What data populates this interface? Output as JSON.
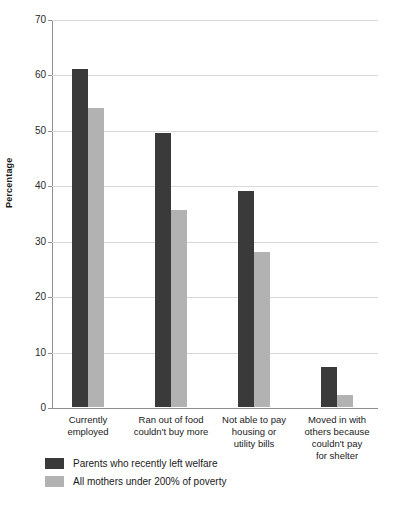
{
  "chart_data": {
    "type": "bar",
    "title": "",
    "xlabel": "",
    "ylabel": "Percentage",
    "ylim": [
      0,
      70
    ],
    "yticks": [
      0,
      10,
      20,
      30,
      40,
      50,
      60,
      70
    ],
    "grid": true,
    "legend_position": "bottom-left",
    "categories": [
      "Currently employed",
      "Ran out of food couldn't buy more",
      "Not able to pay housing or utility bills",
      "Moved in with others because couldn't pay for shelter"
    ],
    "category_lines": [
      [
        "Currently",
        "employed"
      ],
      [
        "Ran out of food",
        "couldn't buy more"
      ],
      [
        "Not able to pay",
        "housing or",
        "utility bills"
      ],
      [
        "Moved in with",
        "others because",
        "couldn't pay",
        "for shelter"
      ]
    ],
    "series": [
      {
        "name": "Parents who recently left welfare",
        "color": "#3a3a3a",
        "values": [
          61,
          49.4,
          39,
          7.3
        ]
      },
      {
        "name": "All mothers under 200% of poverty",
        "color": "#b2b2b2",
        "values": [
          54,
          35.6,
          27.9,
          2.1
        ]
      }
    ]
  },
  "axis": {
    "y_title": "Percentage",
    "tick_labels": [
      "0",
      "10",
      "20",
      "30",
      "40",
      "50",
      "60",
      "70"
    ]
  },
  "legend": {
    "items": [
      {
        "label": "Parents who recently left welfare",
        "swatch": "dark-swatch-icon"
      },
      {
        "label": "All mothers under 200% of poverty",
        "swatch": "light-swatch-icon"
      }
    ]
  }
}
